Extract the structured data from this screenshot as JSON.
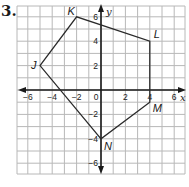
{
  "problem_number": "3.",
  "graph": {
    "x_axis_label": "x",
    "y_axis_label": "y",
    "x_range": [
      -6.5,
      6.5
    ],
    "y_range": [
      -7,
      6.5
    ],
    "grid_step": 1,
    "x_tick_labels": [
      {
        "value": -6,
        "label": "−6"
      },
      {
        "value": -4,
        "label": "−4"
      },
      {
        "value": -2,
        "label": "−2"
      },
      {
        "value": 0,
        "label": "0"
      },
      {
        "value": 2,
        "label": "2"
      },
      {
        "value": 4,
        "label": "4"
      },
      {
        "value": 6,
        "label": "6"
      }
    ],
    "y_tick_labels": [
      {
        "value": 6,
        "label": "6"
      },
      {
        "value": 4,
        "label": "4"
      },
      {
        "value": 2,
        "label": "2"
      },
      {
        "value": -2,
        "label": "−2"
      },
      {
        "value": -4,
        "label": "−4"
      },
      {
        "value": -6,
        "label": "−6"
      }
    ],
    "polygon": {
      "vertices": [
        {
          "name": "J",
          "x": -5,
          "y": 2
        },
        {
          "name": "K",
          "x": -2,
          "y": 6
        },
        {
          "name": "L",
          "x": 4,
          "y": 4
        },
        {
          "name": "M",
          "x": 4,
          "y": -1
        },
        {
          "name": "N",
          "x": 0,
          "y": -4
        }
      ]
    },
    "colors": {
      "grid": "#b8b8b8",
      "axes": "#1a1a1a",
      "polygon": "#2a2a2a",
      "labels": "#1a1a1a"
    }
  }
}
